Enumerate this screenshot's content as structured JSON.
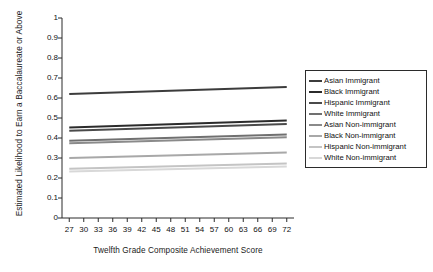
{
  "chart_data": {
    "type": "line",
    "title": "",
    "xlabel": "Twelfth Grade Composite Achievement Score",
    "ylabel": "Estimated Likelihood to Earn a Baccalaureate or Above",
    "xlim": [
      25.5,
      73.5
    ],
    "ylim": [
      0,
      1
    ],
    "xticks": [
      27,
      30,
      33,
      36,
      39,
      42,
      45,
      48,
      51,
      54,
      57,
      60,
      63,
      66,
      69,
      72
    ],
    "yticks": [
      "0",
      "0.1",
      "0.2",
      "0.3",
      "0.4",
      "0.5",
      "0.6",
      "0.7",
      "0.8",
      "0.9",
      "1"
    ],
    "grid": false,
    "legend_position": "right",
    "x": [
      27,
      72
    ],
    "series": [
      {
        "name": "Asian Immigrant",
        "color": "#3c3c3c",
        "values": [
          0.62,
          0.655
        ]
      },
      {
        "name": "Black Immigrant",
        "color": "#2b2b2b",
        "values": [
          0.452,
          0.487
        ]
      },
      {
        "name": "Hispanic Immigrant",
        "color": "#4a4a4a",
        "values": [
          0.436,
          0.47
        ]
      },
      {
        "name": "White Immigrant",
        "color": "#707070",
        "values": [
          0.386,
          0.418
        ]
      },
      {
        "name": "Asian Non-immigrant",
        "color": "#8a8a8a",
        "values": [
          0.374,
          0.404
        ]
      },
      {
        "name": "Black Non-immigrant",
        "color": "#a8a8a8",
        "values": [
          0.3,
          0.327
        ]
      },
      {
        "name": "Hispanic Non-immigrant",
        "color": "#c4c4c4",
        "values": [
          0.246,
          0.272
        ]
      },
      {
        "name": "White Non-immigrant",
        "color": "#d8d8d8",
        "values": [
          0.232,
          0.258
        ]
      }
    ]
  },
  "axes": {
    "x_title": "Twelfth Grade Composite Achievement Score",
    "y_title": "Estimated Likelihood to Earn a Baccalaureate or Above"
  }
}
